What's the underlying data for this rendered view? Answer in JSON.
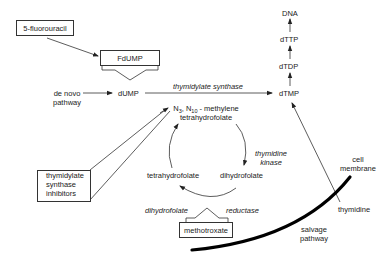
{
  "diagram": {
    "nodes": {
      "fluorouracil": "5-fluorouracil",
      "fdump": "FdUMP",
      "de_novo_line1": "de novo",
      "de_novo_line2": "pathway",
      "dump": "dUMP",
      "dtmp": "dTMP",
      "dtdp": "dTDP",
      "dttp": "dTTP",
      "dna": "DNA",
      "methylene_prefix_n": "N",
      "methylene_sub1": "3",
      "methylene_comma": ", N",
      "methylene_sub2": "10",
      "methylene_suffix": " - methylene",
      "methylene_line2": "tetrahydrofolate",
      "tetrahydrofolate": "tetrahydrofolate",
      "dihydrofolate": "dihydrofolate",
      "ts_inhibitors_line1": "thymidylate",
      "ts_inhibitors_line2": "synthase",
      "ts_inhibitors_line3": "inhibitors",
      "methotrexate": "methotroxate",
      "thymidine": "thymidine",
      "cell_membrane_line1": "cell",
      "cell_membrane_line2": "membrane",
      "salvage_line1": "salvage",
      "salvage_line2": "pathway"
    },
    "enzymes": {
      "thymidylate_synthase": "thymidylate synthase",
      "thymidine_kinase_line1": "thymidine",
      "thymidine_kinase_line2": "kinase",
      "dhfr_left": "dihydrofolate",
      "dhfr_right": "reductase"
    },
    "colors": {
      "line": "#333333",
      "text": "#222222",
      "membrane": "#000000",
      "background": "#ffffff"
    }
  }
}
